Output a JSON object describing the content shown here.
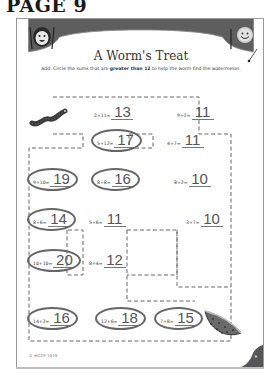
{
  "page_label": "PAGE 9",
  "worksheet": {
    "title": "A Worm's Treat",
    "instructions": {
      "before": "Add. Circle the sums that are ",
      "emphasis": "greater than 12",
      "after": " to help the worm find the watermelon."
    },
    "threshold": 12,
    "equations": [
      {
        "id": "e1",
        "expr": "2+11=",
        "answer": "13",
        "circled": false
      },
      {
        "id": "e2",
        "expr": "9+2=",
        "answer": "11",
        "circled": false
      },
      {
        "id": "e3",
        "expr": "5+12=",
        "answer": "17",
        "circled": true
      },
      {
        "id": "e4",
        "expr": "4+7=",
        "answer": "11",
        "circled": false
      },
      {
        "id": "e5",
        "expr": "9+10=",
        "answer": "19",
        "circled": true
      },
      {
        "id": "e6",
        "expr": "8+8=",
        "answer": "16",
        "circled": true
      },
      {
        "id": "e7",
        "expr": "8+2=",
        "answer": "10",
        "circled": false
      },
      {
        "id": "e8",
        "expr": "8+6=",
        "answer": "14",
        "circled": true
      },
      {
        "id": "e9",
        "expr": "5+6=",
        "answer": "11",
        "circled": false
      },
      {
        "id": "e10",
        "expr": "3+7=",
        "answer": "10",
        "circled": false
      },
      {
        "id": "e11",
        "expr": "10+10=",
        "answer": "20",
        "circled": true
      },
      {
        "id": "e12",
        "expr": "8+4=",
        "answer": "12",
        "circled": false
      },
      {
        "id": "e13",
        "expr": "14+2=",
        "answer": "16",
        "circled": true
      },
      {
        "id": "e14",
        "expr": "12+6=",
        "answer": "18",
        "circled": true
      },
      {
        "id": "e15",
        "expr": "7+8=",
        "answer": "15",
        "circled": true
      }
    ],
    "illustrations": {
      "left_character": "girl-face-icon",
      "right_character": "smiley-face-icon",
      "start": "worm-icon",
      "goal": "watermelon-icon"
    },
    "footer_code": "© MCCP 7019",
    "page_number": "9"
  },
  "colors": {
    "header_band": "#5a5a5a",
    "ink": "#333333",
    "answer_ink": "#555555",
    "circle": "#666666",
    "dash": "#666666"
  }
}
